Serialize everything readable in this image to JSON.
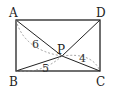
{
  "diagram": {
    "points": {
      "A": {
        "label": "A",
        "x": 16,
        "y": 20
      },
      "B": {
        "label": "B",
        "x": 16,
        "y": 71
      },
      "C": {
        "label": "C",
        "x": 100,
        "y": 71
      },
      "D": {
        "label": "D",
        "x": 100,
        "y": 20
      },
      "P": {
        "label": "P",
        "x": 62,
        "y": 56
      }
    },
    "segments": [
      "AB",
      "BC",
      "CD",
      "DA",
      "PA",
      "PB",
      "PC",
      "PD"
    ],
    "lengths": {
      "PA": "6",
      "PB": "5",
      "PC": "4"
    },
    "colors": {
      "stroke": "#222222",
      "dashed": "#888888"
    }
  }
}
